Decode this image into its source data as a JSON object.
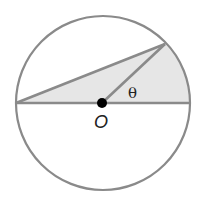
{
  "diagram": {
    "title": "",
    "circle": {
      "cx": 103,
      "cy": 103,
      "r": 87,
      "stroke": "#8a8a8a"
    },
    "shaded_region": {
      "fill": "#e6e6e6",
      "description": "Triangle from left end of diameter to point on circle plus circular segment to right end of diameter"
    },
    "points": {
      "left": [
        16,
        103
      ],
      "right": [
        190,
        103
      ],
      "top": [
        165,
        44
      ],
      "center": [
        102,
        103
      ]
    },
    "labels": {
      "center": "O",
      "angle": "θ"
    },
    "line_color": "#8a8a8a",
    "dot_color": "#000000"
  }
}
